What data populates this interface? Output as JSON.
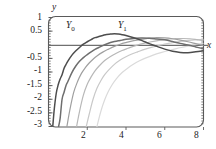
{
  "chart_data": {
    "type": "line",
    "title": "",
    "xlabel": "x",
    "ylabel": "y",
    "xlim": [
      0,
      8
    ],
    "ylim": [
      -3,
      1
    ],
    "grid": false,
    "legend_position": "inline-annotations",
    "xticks": [
      "2",
      "4",
      "6",
      "8"
    ],
    "xtick_values": [
      2,
      4,
      6,
      8
    ],
    "yticks": [
      "1",
      "0.5",
      "-0.5",
      "-1",
      "-1.5",
      "-2",
      "-2.5",
      "-3"
    ],
    "ytick_values": [
      1,
      0.5,
      -0.5,
      -1,
      -1.5,
      -2,
      -2.5,
      -3
    ],
    "annotations": [
      {
        "text": "Y",
        "sub": "0",
        "x": 1.55,
        "y": 0.72
      },
      {
        "text": "Y",
        "sub": "1",
        "x": 3.45,
        "y": 0.72
      }
    ],
    "series": [
      {
        "name": "Y0",
        "color": "#4d4d4d",
        "x": [
          0.22,
          0.3,
          0.4,
          0.5,
          0.6,
          0.7,
          0.8,
          0.9,
          1.0,
          1.2,
          1.4,
          1.6,
          1.8,
          2.0,
          2.2,
          2.4,
          2.6,
          2.8,
          3.0,
          3.2,
          3.4,
          3.6,
          3.8,
          4.0,
          4.4,
          4.8,
          5.2,
          5.6,
          6.0,
          6.4,
          6.8,
          7.2,
          7.6,
          8.0
        ],
        "y": [
          -3.0,
          -2.35,
          -1.78,
          -1.47,
          -1.26,
          -1.1,
          -0.87,
          -0.73,
          -0.6,
          -0.39,
          -0.23,
          -0.1,
          0.02,
          0.11,
          0.19,
          0.26,
          0.3,
          0.34,
          0.38,
          0.39,
          0.4,
          0.39,
          0.37,
          0.34,
          0.26,
          0.16,
          0.04,
          -0.06,
          -0.16,
          -0.24,
          -0.28,
          -0.29,
          -0.26,
          -0.22
        ]
      },
      {
        "name": "Y1",
        "color": "#6e6e6e",
        "x": [
          0.52,
          0.6,
          0.7,
          0.8,
          0.9,
          1.0,
          1.2,
          1.4,
          1.6,
          1.8,
          2.0,
          2.2,
          2.4,
          2.6,
          2.8,
          3.0,
          3.2,
          3.4,
          3.6,
          3.8,
          4.0,
          4.4,
          4.8,
          5.2,
          5.6,
          6.0,
          6.4,
          6.8,
          7.2,
          7.6,
          8.0
        ],
        "y": [
          -3.0,
          -2.7,
          -2.0,
          -1.75,
          -1.5,
          -1.35,
          -1.03,
          -0.79,
          -0.61,
          -0.47,
          -0.36,
          -0.26,
          -0.17,
          -0.1,
          -0.03,
          0.03,
          0.08,
          0.12,
          0.15,
          0.17,
          0.2,
          0.23,
          0.25,
          0.24,
          0.21,
          0.18,
          0.12,
          0.05,
          -0.01,
          -0.08,
          -0.15
        ]
      },
      {
        "name": "Y2",
        "color": "#a0a0a0",
        "x": [
          0.95,
          1.1,
          1.3,
          1.5,
          1.7,
          1.9,
          2.1,
          2.3,
          2.5,
          2.8,
          3.1,
          3.4,
          3.7,
          4.0,
          4.4,
          4.8,
          5.2,
          5.6,
          6.0,
          6.4,
          6.8,
          7.2,
          7.6,
          8.0
        ],
        "y": [
          -3.0,
          -2.4,
          -1.75,
          -1.35,
          -1.05,
          -0.84,
          -0.67,
          -0.53,
          -0.41,
          -0.27,
          -0.16,
          -0.06,
          0.02,
          0.08,
          0.15,
          0.2,
          0.24,
          0.26,
          0.25,
          0.22,
          0.17,
          0.11,
          0.04,
          -0.03
        ]
      },
      {
        "name": "Y3",
        "color": "#b8b8b8",
        "x": [
          1.45,
          1.6,
          1.8,
          2.0,
          2.2,
          2.4,
          2.6,
          2.9,
          3.2,
          3.5,
          3.8,
          4.1,
          4.5,
          4.9,
          5.3,
          5.7,
          6.1,
          6.5,
          6.9,
          7.3,
          7.7,
          8.0
        ],
        "y": [
          -3.0,
          -2.45,
          -1.85,
          -1.45,
          -1.18,
          -0.96,
          -0.79,
          -0.58,
          -0.43,
          -0.31,
          -0.21,
          -0.13,
          -0.03,
          0.05,
          0.11,
          0.16,
          0.2,
          0.22,
          0.23,
          0.22,
          0.18,
          0.15
        ]
      },
      {
        "name": "Y4",
        "color": "#c9c9c9",
        "x": [
          1.95,
          2.1,
          2.3,
          2.5,
          2.7,
          2.9,
          3.1,
          3.4,
          3.7,
          4.0,
          4.3,
          4.6,
          5.0,
          5.4,
          5.8,
          6.2,
          6.6,
          7.0,
          7.4,
          7.8,
          8.0
        ],
        "y": [
          -3.0,
          -2.55,
          -2.0,
          -1.6,
          -1.32,
          -1.1,
          -0.93,
          -0.72,
          -0.56,
          -0.44,
          -0.34,
          -0.26,
          -0.16,
          -0.08,
          -0.01,
          0.05,
          0.1,
          0.14,
          0.17,
          0.19,
          0.2
        ]
      },
      {
        "name": "Y5",
        "color": "#dadada",
        "x": [
          2.5,
          2.7,
          2.9,
          3.1,
          3.3,
          3.5,
          3.8,
          4.1,
          4.4,
          4.7,
          5.0,
          5.4,
          5.8,
          6.2,
          6.6,
          7.0,
          7.4,
          7.8,
          8.0
        ],
        "y": [
          -3.0,
          -2.45,
          -2.02,
          -1.7,
          -1.45,
          -1.25,
          -1.02,
          -0.85,
          -0.71,
          -0.59,
          -0.49,
          -0.38,
          -0.29,
          -0.21,
          -0.14,
          -0.08,
          -0.02,
          0.03,
          0.05
        ]
      }
    ]
  },
  "axes": {
    "y_name": "y",
    "x_name": "x",
    "frame_color": "#5a5a5a",
    "zero_line_color": "#707070"
  }
}
